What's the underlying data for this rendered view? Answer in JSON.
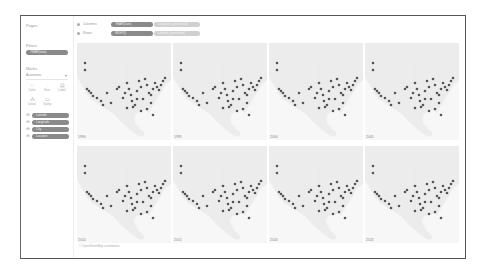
{
  "sidebar": {
    "pages_title": "Pages",
    "filters_title": "Filters",
    "filter_pill": "YEAR(Date)",
    "marks_title": "Marks",
    "mark_type": "Automatic",
    "mark_buttons": [
      {
        "label": "Color",
        "icon": "color-icon"
      },
      {
        "label": "Size",
        "icon": "size-icon"
      },
      {
        "label": "Label",
        "icon": "label-icon"
      },
      {
        "label": "Detail",
        "icon": "detail-icon"
      },
      {
        "label": "Tooltip",
        "icon": "tooltip-icon"
      }
    ],
    "fields": [
      {
        "label": "Latitude"
      },
      {
        "label": "Longitude"
      },
      {
        "label": "City"
      },
      {
        "label": "Location"
      }
    ]
  },
  "shelves": {
    "columns_label": "Columns",
    "rows_label": "Rows",
    "columns_pills": [
      "YEAR(Date)",
      "Longitude (generated)"
    ],
    "rows_pills": [
      "INDEX()",
      "Latitude (generated)"
    ]
  },
  "panels": [
    {
      "year": "1990"
    },
    {
      "year": "1995"
    },
    {
      "year": "2000"
    },
    {
      "year": "2005"
    },
    {
      "year": "2010"
    },
    {
      "year": "2015"
    },
    {
      "year": "2020"
    },
    {
      "year": "2025"
    }
  ],
  "footer": "© OpenStreetMap contributors",
  "colors": {
    "dot": "#555555",
    "land": "#ececec",
    "pill_dark": "#8a8a8a",
    "pill_light": "#cfcfcf"
  }
}
